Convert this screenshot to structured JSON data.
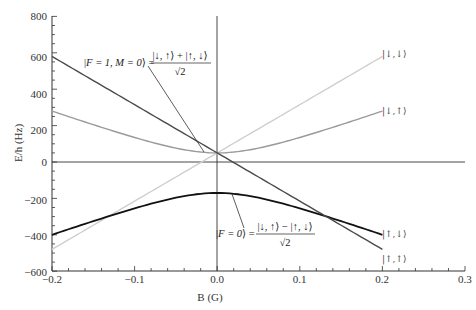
{
  "chart_data": {
    "type": "line",
    "title": "",
    "xlabel": "B (G)",
    "ylabel": "E/h (Hz)",
    "xlim": [
      -0.2,
      0.3
    ],
    "ylim": [
      -600,
      800
    ],
    "x_ticks": [
      "-0.2",
      "-0.1",
      "0.0",
      "0.1",
      "0.2",
      "0.3"
    ],
    "y_ticks": [
      "800",
      "600",
      "400",
      "200",
      "0",
      "-200",
      "-400",
      "-600"
    ],
    "grid": false,
    "zero_lines": {
      "horizontal_at_E": 0,
      "vertical_at_B": 0
    },
    "x": [
      -0.2,
      -0.15,
      -0.1,
      -0.05,
      0.0,
      0.05,
      0.1,
      0.15,
      0.2
    ],
    "series": [
      {
        "name": "|↓,↓⟩",
        "color": "#cccccc",
        "shape": "linear",
        "values": [
          -480,
          -347.5,
          -215,
          -82.5,
          50,
          182.5,
          315,
          447.5,
          580
        ]
      },
      {
        "name": "|↓,↑⟩",
        "color": "#999999",
        "shape": "hyperbolic",
        "values": [
          280,
          186,
          111,
          64,
          50,
          64,
          111,
          186,
          280
        ]
      },
      {
        "name": "|↑,↓⟩",
        "color": "#111111",
        "shape": "hyperbolic",
        "values": [
          -400,
          -306,
          -231,
          -184,
          -170,
          -184,
          -231,
          -306,
          -400
        ]
      },
      {
        "name": "|↑,↑⟩",
        "color": "#555555",
        "shape": "linear",
        "values": [
          580,
          447.5,
          315,
          182.5,
          50,
          -82.5,
          -215,
          -347.5,
          -480
        ]
      }
    ],
    "annotations": [
      {
        "text": "|F = 1, M = 0⟩ = (|↓, ↑⟩ + |↑, ↓⟩)/√2",
        "points_to": {
          "B": -0.01,
          "E": 50
        }
      },
      {
        "text": "|F = 0⟩ = (|↓, ↑⟩ − |↑, ↓⟩)/√2",
        "points_to": {
          "B": 0.025,
          "E": -172
        }
      }
    ]
  },
  "labels": {
    "xlabel": "B (G)",
    "ylabel": "E/h (Hz)",
    "x_ticks": [
      "−0.2",
      "−0.1",
      "0.0",
      "0.1",
      "0.2",
      "0.3"
    ],
    "y_ticks": [
      "800",
      "600",
      "400",
      "200",
      "0",
      "−200",
      "−400",
      "−600"
    ],
    "state_dd": "|↓,↓⟩",
    "state_du": "|↓,↑⟩",
    "state_ud": "|↑,↓⟩",
    "state_uu": "|↑,↑⟩",
    "eq1_lhs_open": "|",
    "eq1_lhs": "F = 1, M = 0",
    "eq1_lhs_close": "⟩ =",
    "eq1_num": "|↓, ↑⟩ + |↑, ↓⟩",
    "eq1_den": "√2",
    "eq2_lhs_open": "|",
    "eq2_lhs": "F = 0",
    "eq2_lhs_close": "⟩ =",
    "eq2_num": "|↓, ↑⟩ − |↑, ↓⟩",
    "eq2_den": "√2"
  }
}
